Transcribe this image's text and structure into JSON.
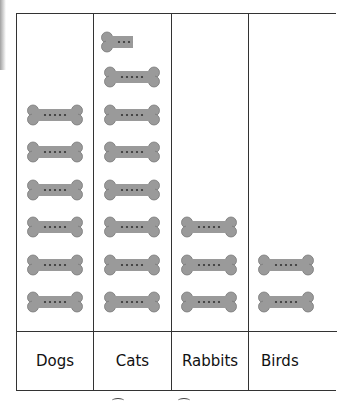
{
  "chart_data": {
    "type": "pictograph",
    "title": "",
    "categories": [
      "Dogs",
      "Cats",
      "Rabbits",
      "Birds"
    ],
    "values": [
      6,
      7.5,
      3,
      2
    ],
    "symbol": "bone-icon",
    "symbol_color": "#9a9a9a",
    "xlabel": "",
    "ylabel": "",
    "grid": true,
    "legend": null
  },
  "colors": {
    "bone_fill": "#9a9a9a",
    "bone_stroke": "#7a7a7a",
    "grid_line": "#333333"
  }
}
